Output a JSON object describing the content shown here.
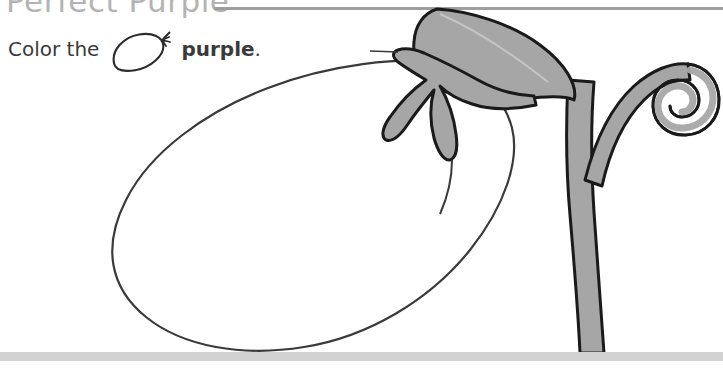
{
  "page": {
    "title": "Perfect Purple",
    "background_color": "#ffffff"
  },
  "header": {
    "title": "Perfect Purple",
    "title_color": "#b3b3b3",
    "rule_color": "#9e9e9e"
  },
  "instruction": {
    "prefix": "Color the",
    "icon_name": "eggplant-outline-icon",
    "target_word": "purple",
    "suffix": ".",
    "full_text": "Color the purple."
  },
  "artwork": {
    "name": "eggplant-coloring-outline",
    "body": {
      "name": "eggplant-body",
      "fill": "#ffffff",
      "stroke": "#333333",
      "filled": false
    },
    "leaf": {
      "name": "eggplant-leaf",
      "fill": "#a6a6a6",
      "stroke": "#1a1a1a"
    },
    "calyx": {
      "name": "eggplant-calyx",
      "fill": "#a6a6a6",
      "stroke": "#1a1a1a"
    },
    "stem": {
      "name": "eggplant-stem",
      "fill": "#a6a6a6",
      "stroke": "#1a1a1a"
    },
    "tendril": {
      "name": "eggplant-tendril-spiral",
      "fill": "#a6a6a6",
      "stroke": "#1a1a1a"
    }
  },
  "ground": {
    "name": "ground-line",
    "color": "#d2d2d2"
  }
}
